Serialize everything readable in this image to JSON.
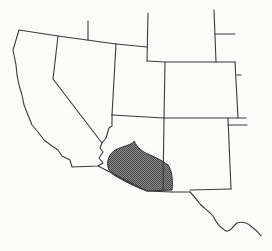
{
  "map": {
    "type": "range-map",
    "region": "Southwestern United States",
    "colors": {
      "background": "#fbfbfa",
      "border": "#3a3a3a",
      "range_fill": "#6e6e6e"
    },
    "highlighted_range": {
      "label": "distribution range",
      "area": "southern Arizona and southwestern New Mexico"
    }
  },
  "caption": {
    "text": ""
  }
}
